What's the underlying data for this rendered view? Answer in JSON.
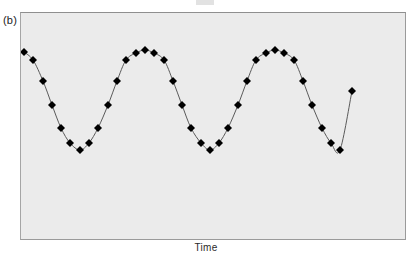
{
  "figure": {
    "panel_label": "(b)",
    "xaxis_label": "Time",
    "plot_background": "#ebebeb",
    "frame_color": "#9a9a9a",
    "marker_color": "#000000",
    "line_color": "#5a5a5a",
    "page_background": "#ffffff"
  },
  "chart_data": {
    "type": "line",
    "title": "",
    "subtitle": "",
    "xlabel": "Time",
    "ylabel": "",
    "grid": false,
    "legend": null,
    "marker": "diamond",
    "marker_size_px": 8,
    "axis_ticks": {
      "x": [],
      "y": []
    },
    "xlim": [
      0,
      34
    ],
    "ylim": [
      -1,
      1
    ],
    "series": [
      {
        "name": "signal",
        "x": [
          0,
          1,
          2,
          3,
          4,
          5,
          6,
          7,
          8,
          9,
          10,
          11,
          12,
          13,
          14,
          15,
          16,
          17,
          18,
          19,
          20,
          21,
          22,
          23,
          24,
          25,
          26,
          27,
          28,
          29,
          30,
          31,
          32,
          33
        ],
        "values": [
          0.87,
          0.71,
          0.31,
          -0.16,
          -0.59,
          -0.89,
          -1.0,
          -0.89,
          -0.59,
          -0.16,
          0.31,
          0.71,
          0.94,
          1.0,
          0.94,
          0.71,
          0.31,
          -0.16,
          -0.59,
          -0.89,
          -1.0,
          -0.89,
          -0.59,
          -0.16,
          0.31,
          0.71,
          0.94,
          1.0,
          0.94,
          0.71,
          0.31,
          -0.16,
          -0.59,
          -0.89
        ]
      }
    ],
    "pixel_points": [
      [
        24,
        52
      ],
      [
        33,
        60
      ],
      [
        43,
        81
      ],
      [
        52,
        105
      ],
      [
        61,
        128
      ],
      [
        70,
        143
      ],
      [
        80,
        150
      ],
      [
        89,
        143
      ],
      [
        98,
        128
      ],
      [
        108,
        105
      ],
      [
        117,
        81
      ],
      [
        126,
        60
      ],
      [
        136,
        53
      ],
      [
        145,
        50
      ],
      [
        154,
        53
      ],
      [
        164,
        60
      ],
      [
        173,
        81
      ],
      [
        182,
        105
      ],
      [
        191,
        128
      ],
      [
        201,
        143
      ],
      [
        210,
        150
      ],
      [
        219,
        143
      ],
      [
        228,
        128
      ],
      [
        238,
        105
      ],
      [
        247,
        81
      ],
      [
        256,
        60
      ],
      [
        266,
        53
      ],
      [
        275,
        50
      ],
      [
        284,
        53
      ],
      [
        294,
        60
      ],
      [
        303,
        81
      ],
      [
        312,
        105
      ],
      [
        322,
        128
      ],
      [
        331,
        143
      ],
      [
        340,
        150
      ],
      [
        352,
        91
      ]
    ]
  }
}
